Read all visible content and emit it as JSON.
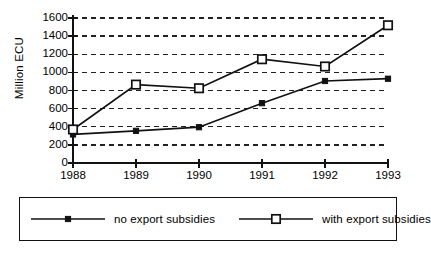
{
  "chart_data": {
    "type": "line",
    "title": "",
    "subtitle": "",
    "xlabel": "",
    "ylabel": "Million ECU",
    "categories": [
      "1988",
      "1989",
      "1990",
      "1991",
      "1992",
      "1993"
    ],
    "x": [
      1988,
      1989,
      1990,
      1991,
      1992,
      1993
    ],
    "ylim": [
      0,
      1600
    ],
    "yticks": [
      0,
      200,
      400,
      600,
      800,
      1000,
      1200,
      1400,
      1600
    ],
    "ytick_labels": [
      "0",
      "200",
      "400",
      "600",
      "800",
      "1000",
      "1200",
      "1400",
      "1600"
    ],
    "grid": true,
    "grid_style": "dashed-horizontal",
    "legend_position": "below-bottom",
    "series": [
      {
        "name": "no export subsidies",
        "marker": "filled-square",
        "values": [
          315,
          355,
          395,
          660,
          905,
          930
        ]
      },
      {
        "name": "with export subsidies",
        "marker": "open-square",
        "values": [
          370,
          865,
          825,
          1145,
          1065,
          1520
        ]
      }
    ]
  },
  "legend": {
    "entries": [
      {
        "label": "no export subsidies",
        "marker": "filled-square-marker"
      },
      {
        "label": "with export subsidies",
        "marker": "open-square-marker"
      }
    ]
  },
  "colors": {
    "line": "#111111",
    "grid": "#222222",
    "axis": "#111111",
    "background": "#ffffff",
    "marker_fill_open": "#ffffff"
  }
}
